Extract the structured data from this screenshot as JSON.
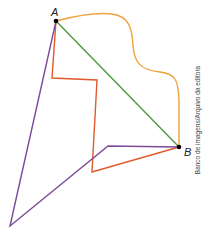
{
  "diagram": {
    "points": {
      "A": {
        "label": "A",
        "x": 56,
        "y": 21
      },
      "B": {
        "label": "B",
        "x": 179,
        "y": 147
      }
    },
    "paths": [
      {
        "name": "green-straight-path",
        "color": "#4e9a3c",
        "d": "M56,21 L179,147"
      },
      {
        "name": "orange-curved-path",
        "color": "#f0a23c",
        "d": "M56,21 C75,16 95,12 112,14 C130,16 132,30 133,45 C134,62 140,70 160,72 C176,74 178,80 179,100 L179,147"
      },
      {
        "name": "red-polygonal-path",
        "color": "#e05a2b",
        "d": "M56,21 L52,78 L97,80 L92,172 L179,147"
      },
      {
        "name": "purple-polygonal-path",
        "color": "#7b4a9a",
        "d": "M56,21 L10,226 L108,146 L179,147"
      }
    ],
    "credit": "Banco de imagens/Arquivo da editora"
  }
}
